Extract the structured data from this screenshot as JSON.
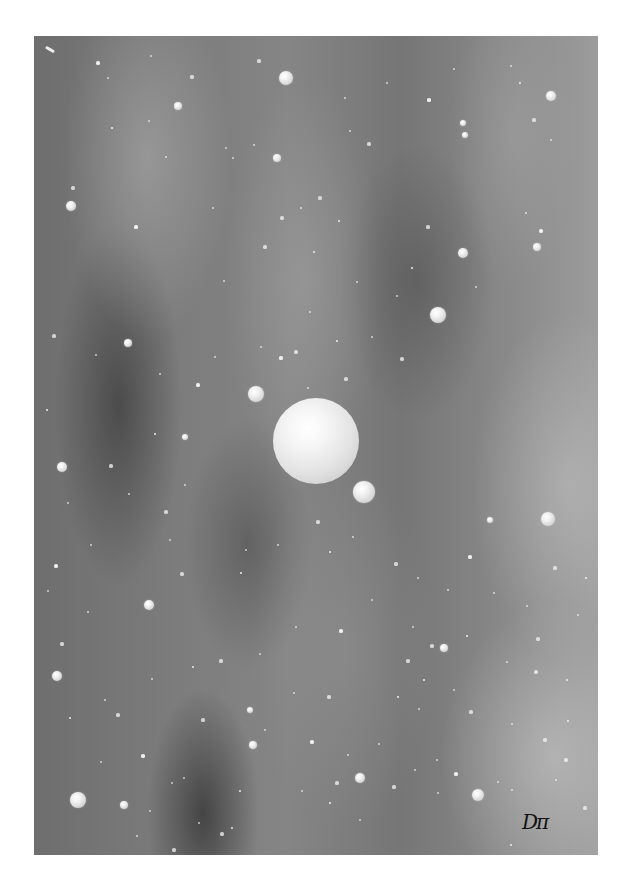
{
  "artwork": {
    "description": "Greyscale space scene with a large central planet, moons and scattered stars over nebula clouds",
    "frame": {
      "left": 34,
      "top": 36,
      "width": 564,
      "height": 819
    },
    "signature": {
      "text": "Dπ",
      "x": 522,
      "y": 812
    },
    "comet": {
      "x": 45,
      "y": 48
    },
    "planet": {
      "cx": 316,
      "cy": 441,
      "r": 43
    },
    "moons": [
      {
        "cx": 256,
        "cy": 394,
        "r": 8
      },
      {
        "cx": 364,
        "cy": 492,
        "r": 11
      }
    ],
    "spheres": [
      {
        "cx": 286,
        "cy": 78,
        "r": 7
      },
      {
        "cx": 551,
        "cy": 96,
        "r": 5
      },
      {
        "cx": 71,
        "cy": 206,
        "r": 5
      },
      {
        "cx": 277,
        "cy": 158,
        "r": 4
      },
      {
        "cx": 463,
        "cy": 253,
        "r": 5
      },
      {
        "cx": 438,
        "cy": 315,
        "r": 8
      },
      {
        "cx": 537,
        "cy": 247,
        "r": 4
      },
      {
        "cx": 128,
        "cy": 343,
        "r": 4
      },
      {
        "cx": 62,
        "cy": 467,
        "r": 5
      },
      {
        "cx": 548,
        "cy": 519,
        "r": 7
      },
      {
        "cx": 149,
        "cy": 605,
        "r": 5
      },
      {
        "cx": 57,
        "cy": 676,
        "r": 5
      },
      {
        "cx": 253,
        "cy": 745,
        "r": 4
      },
      {
        "cx": 444,
        "cy": 648,
        "r": 4
      },
      {
        "cx": 78,
        "cy": 800,
        "r": 8
      },
      {
        "cx": 124,
        "cy": 805,
        "r": 4
      },
      {
        "cx": 360,
        "cy": 778,
        "r": 5
      },
      {
        "cx": 478,
        "cy": 795,
        "r": 6
      },
      {
        "cx": 185,
        "cy": 437,
        "r": 3
      },
      {
        "cx": 465,
        "cy": 135,
        "r": 3
      },
      {
        "cx": 178,
        "cy": 106,
        "r": 4
      },
      {
        "cx": 463,
        "cy": 123,
        "r": 3
      },
      {
        "cx": 250,
        "cy": 710,
        "r": 3
      },
      {
        "cx": 490,
        "cy": 520,
        "r": 3
      }
    ],
    "dots": [
      [
        98,
        63
      ],
      [
        151,
        56
      ],
      [
        108,
        78
      ],
      [
        192,
        77
      ],
      [
        179,
        107
      ],
      [
        226,
        148
      ],
      [
        259,
        61
      ],
      [
        254,
        145
      ],
      [
        112,
        128
      ],
      [
        73,
        188
      ],
      [
        149,
        121
      ],
      [
        166,
        157
      ],
      [
        136,
        227
      ],
      [
        233,
        158
      ],
      [
        213,
        208
      ],
      [
        265,
        247
      ],
      [
        314,
        252
      ],
      [
        310,
        312
      ],
      [
        282,
        218
      ],
      [
        301,
        208
      ],
      [
        339,
        221
      ],
      [
        320,
        198
      ],
      [
        350,
        131
      ],
      [
        387,
        83
      ],
      [
        429,
        100
      ],
      [
        454,
        69
      ],
      [
        511,
        66
      ],
      [
        534,
        120
      ],
      [
        520,
        83
      ],
      [
        551,
        140
      ],
      [
        369,
        144
      ],
      [
        345,
        98
      ],
      [
        412,
        268
      ],
      [
        428,
        227
      ],
      [
        476,
        287
      ],
      [
        526,
        213
      ],
      [
        541,
        231
      ],
      [
        357,
        282
      ],
      [
        397,
        296
      ],
      [
        402,
        359
      ],
      [
        337,
        341
      ],
      [
        308,
        388
      ],
      [
        346,
        379
      ],
      [
        372,
        337
      ],
      [
        350,
        420
      ],
      [
        296,
        352
      ],
      [
        224,
        281
      ],
      [
        215,
        357
      ],
      [
        198,
        385
      ],
      [
        160,
        374
      ],
      [
        96,
        355
      ],
      [
        54,
        336
      ],
      [
        47,
        410
      ],
      [
        68,
        503
      ],
      [
        111,
        466
      ],
      [
        129,
        494
      ],
      [
        155,
        434
      ],
      [
        166,
        512
      ],
      [
        185,
        485
      ],
      [
        261,
        347
      ],
      [
        281,
        358
      ],
      [
        246,
        550
      ],
      [
        170,
        540
      ],
      [
        182,
        574
      ],
      [
        241,
        573
      ],
      [
        278,
        545
      ],
      [
        318,
        522
      ],
      [
        353,
        537
      ],
      [
        330,
        552
      ],
      [
        396,
        564
      ],
      [
        418,
        578
      ],
      [
        448,
        590
      ],
      [
        470,
        557
      ],
      [
        494,
        593
      ],
      [
        527,
        606
      ],
      [
        555,
        568
      ],
      [
        586,
        578
      ],
      [
        578,
        615
      ],
      [
        538,
        639
      ],
      [
        507,
        662
      ],
      [
        467,
        636
      ],
      [
        432,
        646
      ],
      [
        413,
        627
      ],
      [
        372,
        600
      ],
      [
        341,
        631
      ],
      [
        296,
        627
      ],
      [
        260,
        654
      ],
      [
        221,
        661
      ],
      [
        193,
        667
      ],
      [
        152,
        679
      ],
      [
        118,
        715
      ],
      [
        101,
        762
      ],
      [
        70,
        718
      ],
      [
        62,
        644
      ],
      [
        48,
        591
      ],
      [
        105,
        700
      ],
      [
        143,
        756
      ],
      [
        172,
        783
      ],
      [
        184,
        778
      ],
      [
        203,
        720
      ],
      [
        240,
        791
      ],
      [
        302,
        791
      ],
      [
        337,
        783
      ],
      [
        360,
        820
      ],
      [
        330,
        803
      ],
      [
        394,
        787
      ],
      [
        415,
        770
      ],
      [
        437,
        760
      ],
      [
        456,
        774
      ],
      [
        498,
        782
      ],
      [
        512,
        790
      ],
      [
        545,
        740
      ],
      [
        568,
        721
      ],
      [
        556,
        780
      ],
      [
        585,
        808
      ],
      [
        419,
        709
      ],
      [
        398,
        697
      ],
      [
        329,
        697
      ],
      [
        294,
        693
      ],
      [
        265,
        730
      ],
      [
        312,
        742
      ],
      [
        348,
        755
      ],
      [
        379,
        744
      ],
      [
        536,
        672
      ],
      [
        567,
        680
      ],
      [
        512,
        724
      ],
      [
        471,
        712
      ],
      [
        454,
        690
      ],
      [
        424,
        680
      ],
      [
        408,
        661
      ],
      [
        91,
        545
      ],
      [
        88,
        612
      ],
      [
        56,
        566
      ],
      [
        150,
        811
      ],
      [
        137,
        836
      ],
      [
        222,
        834
      ],
      [
        232,
        828
      ],
      [
        199,
        823
      ],
      [
        174,
        850
      ],
      [
        438,
        793
      ],
      [
        511,
        845
      ],
      [
        566,
        760
      ]
    ]
  }
}
